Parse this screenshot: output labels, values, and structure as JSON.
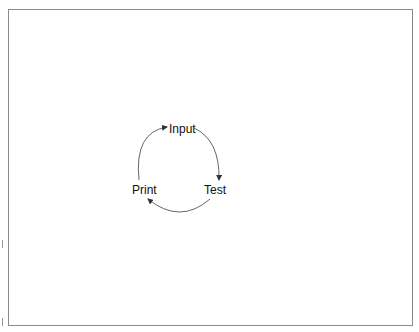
{
  "diagram": {
    "type": "cycle",
    "border_color": "#8a8a8a",
    "arrow_color": "#444444",
    "text_color": "#111111",
    "nodes": [
      {
        "id": "input",
        "label": "Input"
      },
      {
        "id": "test",
        "label": "Test"
      },
      {
        "id": "print",
        "label": "Print"
      }
    ],
    "edges": [
      {
        "from": "input",
        "to": "test"
      },
      {
        "from": "test",
        "to": "print"
      },
      {
        "from": "print",
        "to": "input"
      }
    ]
  }
}
